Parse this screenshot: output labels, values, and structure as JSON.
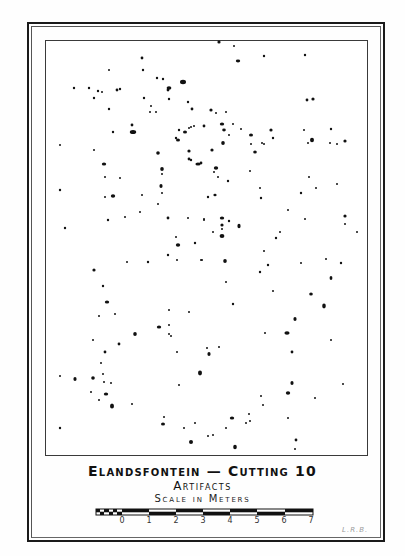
{
  "map": {
    "title": "Elandsfontein — Cutting 10",
    "subtitle": "Artifacts",
    "scale_label": "Scale in Meters",
    "scale_ticks": [
      "0",
      "1",
      "2",
      "3",
      "4",
      "5",
      "6",
      "7"
    ],
    "scale_units": "meters",
    "initials": "L.R.B."
  },
  "colors": {
    "ink": "#111111",
    "paper": "#ffffff",
    "frame": "#1a1a1a"
  },
  "artifacts": [
    [
      74,
      88,
      1.2
    ],
    [
      89,
      88,
      1.2
    ],
    [
      98,
      91,
      1.2
    ],
    [
      102,
      92,
      1.0
    ],
    [
      94,
      98,
      1.2
    ],
    [
      109,
      109,
      1.2
    ],
    [
      109,
      70,
      1.0
    ],
    [
      142,
      58,
      1.4
    ],
    [
      143,
      70,
      1.2
    ],
    [
      117,
      90,
      1.4
    ],
    [
      120,
      89,
      1.2
    ],
    [
      157,
      78,
      1.2
    ],
    [
      144,
      98,
      1.2
    ],
    [
      151,
      106,
      1.0
    ],
    [
      150,
      112,
      1.0
    ],
    [
      156,
      112,
      1.0
    ],
    [
      132,
      125,
      1.4
    ],
    [
      113,
      132,
      1.2
    ],
    [
      133,
      132,
      3.2,
      2.0
    ],
    [
      163,
      79,
      1.2
    ],
    [
      168,
      90,
      1.4
    ],
    [
      169,
      99,
      1.2
    ],
    [
      183,
      82,
      3.0,
      2.2
    ],
    [
      169,
      88,
      2.4,
      1.8
    ],
    [
      192,
      109,
      1.4
    ],
    [
      188,
      102,
      1.2
    ],
    [
      191,
      127,
      1.0
    ],
    [
      179,
      130,
      1.2
    ],
    [
      185,
      132,
      2.0,
      1.6
    ],
    [
      176,
      138,
      1.2
    ],
    [
      178,
      140,
      2.0,
      1.6
    ],
    [
      189,
      128,
      1.0
    ],
    [
      194,
      126,
      1.0
    ],
    [
      219,
      42,
      1.6
    ],
    [
      234,
      46,
      1.0
    ],
    [
      238,
      61,
      2.2,
      1.4
    ],
    [
      264,
      56,
      1.2
    ],
    [
      305,
      55,
      1.2
    ],
    [
      307,
      100,
      1.4
    ],
    [
      313,
      99,
      1.6
    ],
    [
      211,
      110,
      1.6
    ],
    [
      216,
      113,
      1.0
    ],
    [
      226,
      112,
      1.0
    ],
    [
      222,
      124,
      2.2,
      1.6
    ],
    [
      224,
      130,
      1.8,
      1.4
    ],
    [
      233,
      124,
      1.0
    ],
    [
      241,
      129,
      1.0
    ],
    [
      229,
      135,
      1.0
    ],
    [
      251,
      135,
      2.0,
      1.6
    ],
    [
      271,
      130,
      1.6
    ],
    [
      273,
      138,
      1.2
    ],
    [
      251,
      144,
      1.0
    ],
    [
      204,
      126,
      1.4
    ],
    [
      304,
      130,
      1.0
    ],
    [
      331,
      129,
      1.2
    ],
    [
      312,
      140,
      2.0,
      2.2
    ],
    [
      308,
      143,
      1.0
    ],
    [
      330,
      143,
      1.0
    ],
    [
      337,
      144,
      1.0
    ],
    [
      345,
      141,
      1.6
    ],
    [
      60,
      145,
      1.0
    ],
    [
      94,
      150,
      1.0
    ],
    [
      158,
      153,
      1.8
    ],
    [
      104,
      164,
      2.2,
      1.6
    ],
    [
      162,
      169,
      1.8,
      2.0
    ],
    [
      189,
      151,
      1.6
    ],
    [
      189,
      159,
      1.4
    ],
    [
      191,
      160,
      1.2
    ],
    [
      198,
      164,
      2.6,
      1.6
    ],
    [
      162,
      174,
      1.0
    ],
    [
      105,
      177,
      1.0
    ],
    [
      120,
      178,
      1.0
    ],
    [
      60,
      190,
      1.2
    ],
    [
      161,
      186,
      1.6,
      2.0
    ],
    [
      162,
      193,
      1.0
    ],
    [
      105,
      197,
      1.0
    ],
    [
      113,
      196,
      2.2,
      1.8
    ],
    [
      142,
      195,
      1.0
    ],
    [
      158,
      204,
      1.0
    ],
    [
      140,
      212,
      1.0
    ],
    [
      125,
      217,
      1.0
    ],
    [
      108,
      220,
      1.2
    ],
    [
      168,
      218,
      1.4
    ],
    [
      188,
      218,
      1.0
    ],
    [
      204,
      220,
      1.0
    ],
    [
      65,
      228,
      1.2
    ],
    [
      176,
      237,
      1.0
    ],
    [
      178,
      245,
      2.2,
      1.8
    ],
    [
      195,
      243,
      1.2
    ],
    [
      223,
      143,
      1.8,
      2.0
    ],
    [
      212,
      150,
      1.6
    ],
    [
      255,
      152,
      1.8,
      1.6
    ],
    [
      262,
      143,
      1.0
    ],
    [
      264,
      144,
      1.0
    ],
    [
      201,
      163,
      1.4
    ],
    [
      216,
      168,
      2.2,
      1.8
    ],
    [
      214,
      172,
      1.0
    ],
    [
      218,
      177,
      1.0
    ],
    [
      228,
      181,
      1.2
    ],
    [
      250,
      171,
      1.0
    ],
    [
      260,
      188,
      1.0
    ],
    [
      261,
      198,
      1.2
    ],
    [
      309,
      177,
      1.0
    ],
    [
      316,
      188,
      1.0
    ],
    [
      337,
      184,
      1.0
    ],
    [
      301,
      193,
      1.2
    ],
    [
      208,
      197,
      1.2
    ],
    [
      215,
      195,
      1.6,
      1.2
    ],
    [
      222,
      218,
      2.2,
      1.6
    ],
    [
      204,
      219,
      1.0
    ],
    [
      222,
      225,
      1.6
    ],
    [
      229,
      221,
      1.2
    ],
    [
      239,
      226,
      1.6,
      2.2
    ],
    [
      222,
      229,
      1.0
    ],
    [
      213,
      232,
      1.0
    ],
    [
      222,
      236,
      2.4,
      2.0
    ],
    [
      288,
      210,
      1.0
    ],
    [
      305,
      219,
      1.0
    ],
    [
      345,
      216,
      1.6
    ],
    [
      345,
      224,
      1.0
    ],
    [
      280,
      232,
      1.0
    ],
    [
      276,
      238,
      1.2
    ],
    [
      357,
      232,
      1.0
    ],
    [
      168,
      255,
      1.2
    ],
    [
      127,
      262,
      1.0
    ],
    [
      148,
      262,
      1.2
    ],
    [
      177,
      260,
      1.0
    ],
    [
      201,
      260,
      1.0
    ],
    [
      94,
      270,
      1.6
    ],
    [
      103,
      286,
      1.2
    ],
    [
      107,
      302,
      2.2,
      1.6
    ],
    [
      99,
      316,
      1.0
    ],
    [
      115,
      314,
      1.0
    ],
    [
      169,
      310,
      1.0
    ],
    [
      189,
      312,
      1.0
    ],
    [
      159,
      327,
      2.2,
      1.6
    ],
    [
      169,
      325,
      1.0
    ],
    [
      135,
      334,
      1.8,
      2.0
    ],
    [
      169,
      334,
      1.0
    ],
    [
      171,
      336,
      1.0
    ],
    [
      93,
      340,
      1.0
    ],
    [
      119,
      344,
      1.4
    ],
    [
      105,
      352,
      1.4
    ],
    [
      177,
      352,
      1.0
    ],
    [
      264,
      251,
      1.0
    ],
    [
      202,
      260,
      1.0
    ],
    [
      225,
      261,
      1.8,
      2.0
    ],
    [
      268,
      265,
      1.2
    ],
    [
      260,
      272,
      1.2
    ],
    [
      301,
      263,
      1.0
    ],
    [
      326,
      259,
      1.0
    ],
    [
      341,
      263,
      1.2
    ],
    [
      331,
      278,
      1.4,
      2.0
    ],
    [
      226,
      282,
      1.0
    ],
    [
      273,
      291,
      1.0
    ],
    [
      311,
      294,
      1.8,
      1.6
    ],
    [
      324,
      306,
      1.8,
      2.4
    ],
    [
      233,
      304,
      1.2
    ],
    [
      295,
      319,
      1.6,
      2.0
    ],
    [
      265,
      333,
      1.0
    ],
    [
      287,
      333,
      2.6,
      1.8
    ],
    [
      331,
      340,
      1.0
    ],
    [
      207,
      348,
      1.0
    ],
    [
      219,
      347,
      1.0
    ],
    [
      209,
      354,
      1.6,
      2.0
    ],
    [
      292,
      352,
      1.4
    ],
    [
      101,
      363,
      1.0
    ],
    [
      103,
      374,
      1.0
    ],
    [
      60,
      376,
      1.0
    ],
    [
      75,
      379,
      1.6,
      2.0
    ],
    [
      93,
      378,
      1.8
    ],
    [
      104,
      382,
      1.0
    ],
    [
      111,
      383,
      1.0
    ],
    [
      91,
      392,
      1.0
    ],
    [
      106,
      394,
      2.2,
      1.6
    ],
    [
      99,
      400,
      1.0
    ],
    [
      112,
      406,
      2.0,
      2.6
    ],
    [
      132,
      404,
      1.0
    ],
    [
      60,
      428,
      1.2
    ],
    [
      164,
      417,
      1.0
    ],
    [
      163,
      424,
      2.0,
      1.6
    ],
    [
      184,
      428,
      1.0
    ],
    [
      195,
      423,
      1.0
    ],
    [
      191,
      442,
      2.0,
      2.0
    ],
    [
      179,
      385,
      1.0
    ],
    [
      200,
      373,
      2.0,
      2.4
    ],
    [
      292,
      383,
      1.6,
      2.0
    ],
    [
      288,
      393,
      2.2,
      1.8
    ],
    [
      343,
      384,
      1.0
    ],
    [
      261,
      396,
      1.0
    ],
    [
      263,
      405,
      1.0
    ],
    [
      315,
      398,
      1.0
    ],
    [
      249,
      414,
      1.0
    ],
    [
      250,
      421,
      1.0
    ],
    [
      246,
      423,
      1.0
    ],
    [
      232,
      418,
      2.2,
      1.6
    ],
    [
      226,
      428,
      1.0
    ],
    [
      288,
      418,
      1.0
    ],
    [
      208,
      436,
      1.0
    ],
    [
      213,
      435,
      1.0
    ],
    [
      235,
      447,
      1.8,
      2.2
    ],
    [
      296,
      440,
      1.4
    ],
    [
      295,
      449,
      1.0
    ]
  ]
}
